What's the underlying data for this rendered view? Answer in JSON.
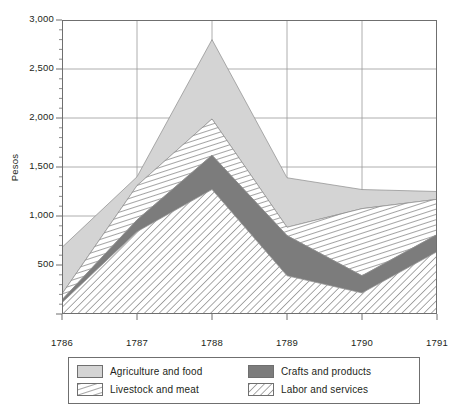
{
  "chart_data": {
    "type": "area",
    "stacked": true,
    "title": "",
    "xlabel": "",
    "ylabel": "Pesos",
    "categories": [
      "1786",
      "1787",
      "1788",
      "1789",
      "1790",
      "1791"
    ],
    "x": [
      1786,
      1787,
      1788,
      1789,
      1790,
      1791
    ],
    "ylim": [
      0,
      3000
    ],
    "yticks": [
      0,
      500,
      1000,
      1500,
      2000,
      2500,
      3000
    ],
    "ytick_labels": [
      "",
      "500",
      "1,000",
      "1,500",
      "2,000",
      "2,500",
      "3,000"
    ],
    "minor_tick_interval": 100,
    "grid": "horizontal-and-vertical",
    "legend_position": "bottom",
    "series": [
      {
        "name": "Labor and services",
        "fill": "diagonal-hatch-up",
        "color": "#ffffff",
        "hatch_color": "#8d8d8d",
        "values": [
          115,
          840,
          1270,
          390,
          215,
          635
        ]
      },
      {
        "name": "Crafts and products",
        "fill": "solid",
        "color": "#7c7c7c",
        "values": [
          30,
          120,
          350,
          410,
          175,
          175
        ]
      },
      {
        "name": "Livestock and meat",
        "fill": "steep-hatch",
        "color": "#ffffff",
        "hatch_color": "#8d8d8d",
        "values": [
          60,
          350,
          370,
          85,
          685,
          360
        ]
      },
      {
        "name": "Agriculture and food",
        "fill": "solid",
        "color": "#d4d4d4",
        "values": [
          475,
          90,
          810,
          505,
          195,
          80
        ]
      }
    ],
    "cumulative_tops": {
      "labor_and_services": [
        115,
        840,
        1270,
        390,
        215,
        635
      ],
      "crafts_and_products": [
        145,
        960,
        1620,
        800,
        390,
        810
      ],
      "livestock_and_meat": [
        205,
        1310,
        1990,
        885,
        1075,
        1170
      ],
      "agriculture_and_food": [
        680,
        1400,
        2800,
        1390,
        1270,
        1250
      ]
    }
  },
  "legend": {
    "items": [
      {
        "label": "Agriculture and food",
        "swatch": "solid-light-gray"
      },
      {
        "label": "Crafts and products",
        "swatch": "solid-dark-gray"
      },
      {
        "label": "Livestock and meat",
        "swatch": "steep-hatch"
      },
      {
        "label": "Labor and services",
        "swatch": "diagonal-hatch"
      }
    ]
  },
  "colors": {
    "agriculture": "#d4d4d4",
    "crafts": "#7c7c7c",
    "hatch": "#8d8d8d",
    "axis": "#6f6f6f",
    "grid": "#9a9a9a",
    "text": "#231f20"
  }
}
